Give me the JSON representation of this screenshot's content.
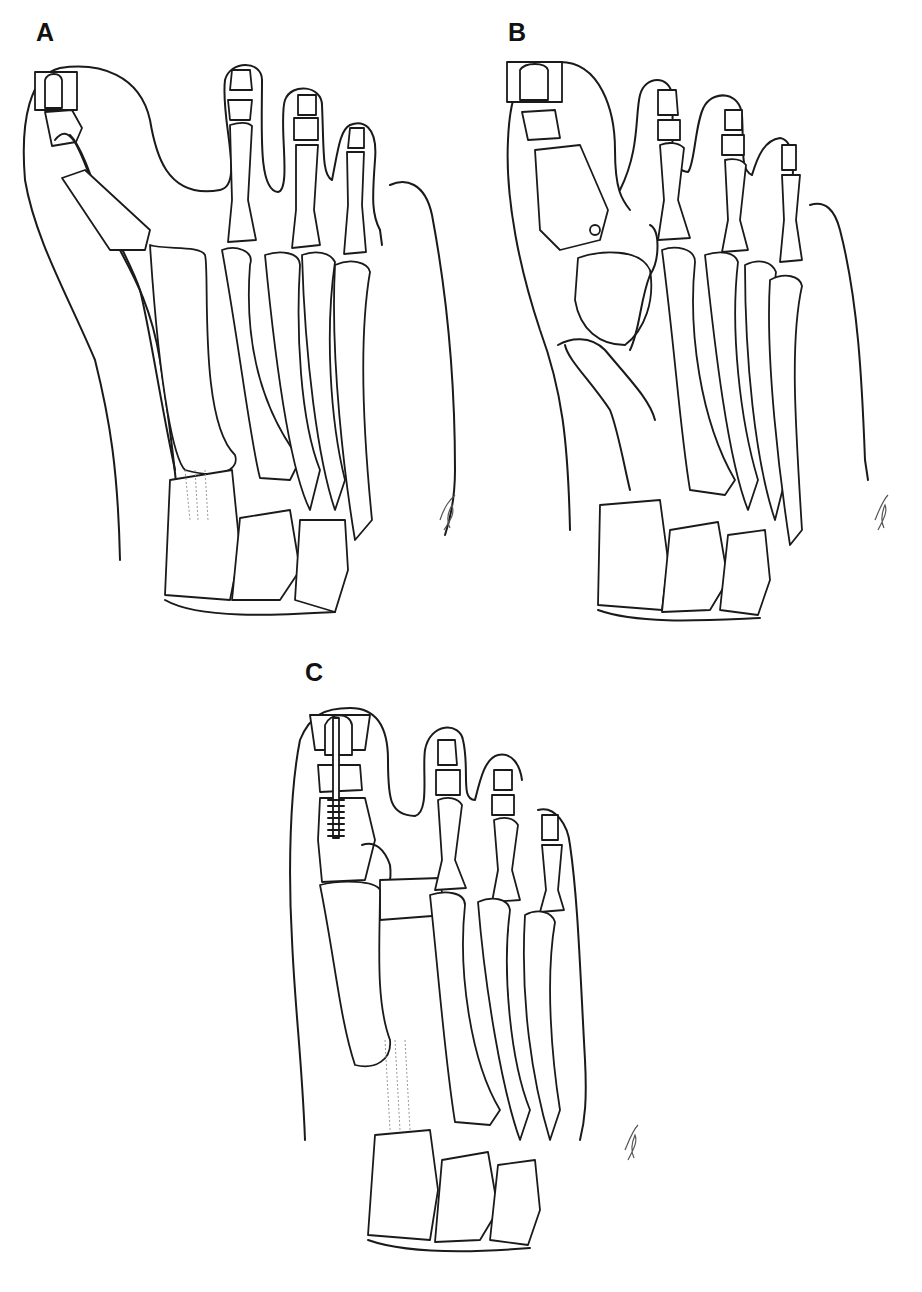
{
  "figure": {
    "panels": [
      {
        "id": "A",
        "label": "A",
        "description": "Dorsal view of forefoot with tendon transferred through hallux and boxed distal phalanx region"
      },
      {
        "id": "B",
        "label": "B",
        "description": "Dorsal view of forefoot with tendon looped around first metatarsal head and drill hole in proximal phalanx"
      },
      {
        "id": "C",
        "label": "C",
        "description": "Dorsal view of forefoot with interphalangeal screw fixation of hallux and tendon sutured"
      }
    ],
    "signature": "artist signature",
    "colors": {
      "line": "#1a1a1a",
      "background": "#ffffff",
      "shading": "#9a9a9a"
    }
  }
}
